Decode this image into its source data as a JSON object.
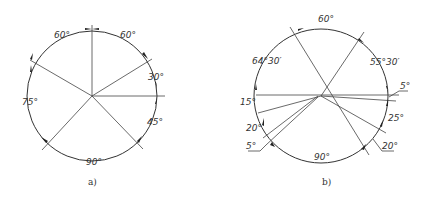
{
  "figure": {
    "panels": [
      {
        "id": "a",
        "caption": "a)",
        "center": [
          92,
          96
        ],
        "radius": 65,
        "ray_angles_deg": [
          90,
          30,
          0,
          -45,
          -135,
          150
        ],
        "labels": {
          "top_left": "60°",
          "top_right": "60°",
          "right_upper": "30°",
          "right_lower": "45°",
          "bottom": "90°",
          "left": "75°"
        }
      },
      {
        "id": "b",
        "caption": "b)",
        "center": [
          321,
          96
        ],
        "radius": 67,
        "labels": {
          "top": "60°",
          "top_left": "64°30′",
          "top_right": "55°30′",
          "right_small": "5°",
          "left_upper": "15°",
          "right_lower": "25°",
          "left_lower": "20°",
          "left_small": "5°",
          "right_bottom": "20°",
          "bottom": "90°"
        }
      }
    ]
  }
}
